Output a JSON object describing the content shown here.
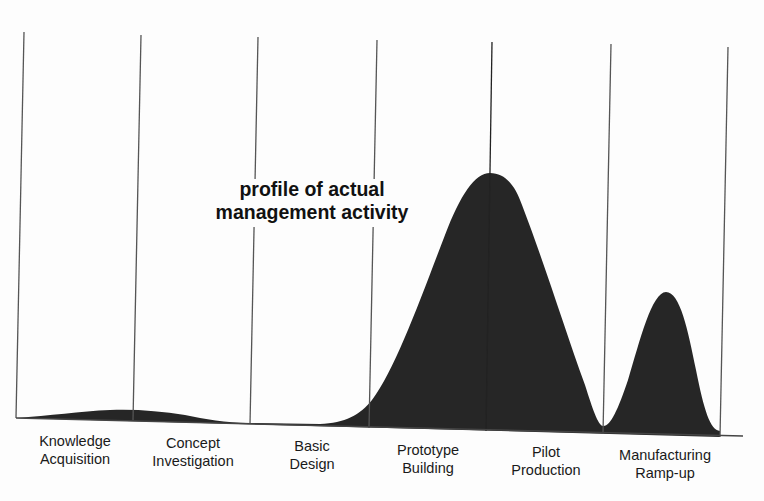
{
  "annotation": {
    "line1": "profile of actual",
    "line2": "management activity"
  },
  "phases": [
    {
      "line1": "Knowledge",
      "line2": "Acquisition"
    },
    {
      "line1": "Concept",
      "line2": "Investigation"
    },
    {
      "line1": "Basic",
      "line2": "Design"
    },
    {
      "line1": "Prototype",
      "line2": "Building"
    },
    {
      "line1": "Pilot",
      "line2": "Production"
    },
    {
      "line1": "Manufacturing",
      "line2": "Ramp-up"
    }
  ],
  "colors": {
    "fill": "#262626",
    "lines": "#555555",
    "background": "#fdfdfd"
  }
}
